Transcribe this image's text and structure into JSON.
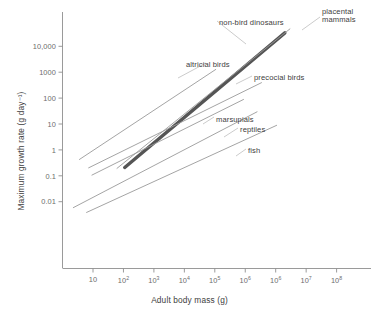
{
  "chart_data": {
    "type": "line",
    "title": "",
    "xlabel": "Adult body mass (g)",
    "ylabel": "Maximum growth rate (g day⁻¹)",
    "xscale": "log",
    "yscale": "log",
    "xlim": [
      1,
      1000000000
    ],
    "ylim": [
      0.001,
      100000
    ],
    "grid": false,
    "legend_position": "inline-labels",
    "xticks": [
      {
        "label": "10",
        "mantissa": "10",
        "exponent": "",
        "value": 10
      },
      {
        "label": "10²",
        "mantissa": "10",
        "exponent": "2",
        "value": 100
      },
      {
        "label": "10³",
        "mantissa": "10",
        "exponent": "3",
        "value": 1000
      },
      {
        "label": "10⁴",
        "mantissa": "10",
        "exponent": "4",
        "value": 10000
      },
      {
        "label": "10⁵",
        "mantissa": "10",
        "exponent": "5",
        "value": 100000
      },
      {
        "label": "10⁶",
        "mantissa": "10",
        "exponent": "6",
        "value": 1000000
      },
      {
        "label": "10⁶",
        "mantissa": "10",
        "exponent": "6",
        "value": 10000000
      },
      {
        "label": "10⁷",
        "mantissa": "10",
        "exponent": "7",
        "value": 100000000
      },
      {
        "label": "10⁸",
        "mantissa": "10",
        "exponent": "8",
        "value": 1000000000
      }
    ],
    "yticks": [
      {
        "label": "10,000",
        "value": 10000
      },
      {
        "label": "1000",
        "value": 1000
      },
      {
        "label": "100",
        "value": 100
      },
      {
        "label": "10",
        "value": 10
      },
      {
        "label": "1",
        "value": 1
      },
      {
        "label": "0.1",
        "value": 0.1
      },
      {
        "label": "0.01",
        "value": 0.01
      }
    ],
    "series": [
      {
        "name": "non-bird dinosaurs",
        "label": "non-bird dinosaurs",
        "color": "#555555",
        "width": 3.4,
        "emphasis": true,
        "x": [
          110,
          20000000
        ],
        "y": [
          0.21,
          33000
        ]
      },
      {
        "name": "placental mammals",
        "label": "placental mammals",
        "label_line1": "placental",
        "label_line2": "mammals",
        "color": "#9a9a9a",
        "width": 0.9,
        "emphasis": false,
        "x": [
          60,
          30000000
        ],
        "y": [
          0.19,
          48000
        ]
      },
      {
        "name": "altricial birds",
        "label": "altricial birds",
        "color": "#9a9a9a",
        "width": 0.9,
        "emphasis": false,
        "x": [
          3.5,
          110000
        ],
        "y": [
          0.42,
          1300
        ]
      },
      {
        "name": "precocial birds",
        "label": "precocial birds",
        "color": "#9a9a9a",
        "width": 0.9,
        "emphasis": false,
        "x": [
          7,
          3500000
        ],
        "y": [
          0.2,
          400
        ]
      },
      {
        "name": "marsupials",
        "label": "marsupials",
        "color": "#9a9a9a",
        "width": 0.9,
        "emphasis": false,
        "x": [
          9,
          900000
        ],
        "y": [
          0.105,
          90
        ]
      },
      {
        "name": "reptiles",
        "label": "reptiles",
        "color": "#9a9a9a",
        "width": 0.9,
        "emphasis": false,
        "x": [
          2.2,
          2500000
        ],
        "y": [
          0.0058,
          30
        ]
      },
      {
        "name": "fish",
        "label": "fish",
        "color": "#9a9a9a",
        "width": 0.9,
        "emphasis": false,
        "x": [
          6,
          11000000
        ],
        "y": [
          0.0038,
          9
        ]
      }
    ],
    "annotations": [
      {
        "text": "non-bird dinosaurs",
        "x_px": 219,
        "y_px": 19
      },
      {
        "text": "placental",
        "x_px": 322,
        "y_px": 8
      },
      {
        "text": "mammals",
        "x_px": 322,
        "y_px": 16
      },
      {
        "text": "altricial birds",
        "x_px": 186,
        "y_px": 61
      },
      {
        "text": "precocial birds",
        "x_px": 254,
        "y_px": 74
      },
      {
        "text": "marsupials",
        "x_px": 216,
        "y_px": 116
      },
      {
        "text": "reptiles",
        "x_px": 240,
        "y_px": 126
      },
      {
        "text": "fish",
        "x_px": 248,
        "y_px": 147
      }
    ]
  },
  "axes": {
    "x_axis_label": "Adult body mass (g)",
    "y_axis_label": "Maximum growth rate (g day⁻¹)"
  }
}
